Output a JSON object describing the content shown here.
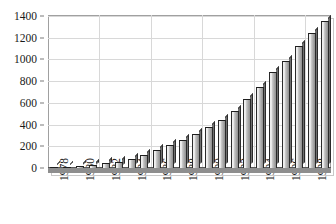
{
  "chart_data": {
    "type": "bar",
    "title": "",
    "subtitle": "",
    "xlabel": "",
    "ylabel": "",
    "categories": [
      "1978",
      "1979",
      "1980",
      "1981",
      "1982",
      "1983",
      "1984",
      "1985",
      "1986",
      "1987",
      "1988",
      "1989",
      "1990",
      "1991",
      "1992",
      "1993",
      "1994",
      "1995",
      "1996",
      "1997",
      "1998",
      "1999"
    ],
    "tick_labels": [
      "1978",
      "1980",
      "1982",
      "1984",
      "1986",
      "1988",
      "1990",
      "1992",
      "1994",
      "1996",
      "1998"
    ],
    "values": [
      10,
      12,
      18,
      25,
      42,
      60,
      85,
      120,
      165,
      210,
      258,
      315,
      375,
      440,
      525,
      635,
      750,
      880,
      990,
      1120,
      1240,
      1320
    ],
    "last_value": 1350,
    "ylim": [
      0,
      1400
    ],
    "ytick_labels": [
      "0",
      "200",
      "400",
      "600",
      "800",
      "1000",
      "1200",
      "1400"
    ],
    "ytick_values": [
      0,
      200,
      400,
      600,
      800,
      1000,
      1200,
      1400
    ],
    "grid": true,
    "legend": "none",
    "series": [
      {
        "name": "series-1",
        "values": [
          10,
          12,
          18,
          25,
          42,
          60,
          85,
          120,
          165,
          210,
          258,
          315,
          375,
          440,
          525,
          635,
          750,
          880,
          990,
          1120,
          1240,
          1350
        ]
      }
    ],
    "colors": {
      "bar_fill_light": "#efefef",
      "bar_fill_dark": "#8f8f8f",
      "bar_outline": "#2a2a2a",
      "gridline": "#d8d8d8",
      "axis": "#a0a0a0",
      "text": "#1a1a1a",
      "floor": "#8e8e8e",
      "background": "#ffffff"
    }
  }
}
